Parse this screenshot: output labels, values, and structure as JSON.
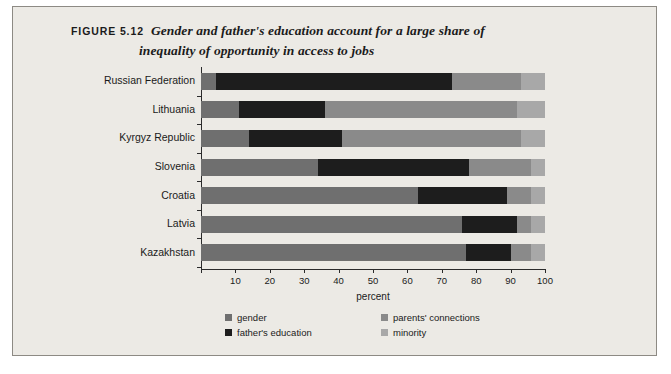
{
  "figure": {
    "number": "FIGURE 5.12",
    "title_line_1": "Gender and father's education account for a large share of",
    "title_line_2": "inequality of opportunity in access to jobs"
  },
  "colors": {
    "panel_background": "#eceae5",
    "gender": "#6f6f6f",
    "father_education": "#1d1d1d",
    "parents_connections": "#8a8a8a",
    "minority": "#a8a8a8",
    "axis": "#2b2b2b"
  },
  "chart_data": {
    "type": "bar",
    "orientation": "horizontal",
    "stacked": true,
    "title": "Gender and father's education account for a large share of inequality of opportunity in access to jobs",
    "xlabel": "percent",
    "ylabel": "",
    "xlim": [
      0,
      100
    ],
    "xticks": [
      0,
      10,
      20,
      30,
      40,
      50,
      60,
      70,
      80,
      90,
      100
    ],
    "xtick_labels": [
      "",
      "10",
      "20",
      "30",
      "40",
      "50",
      "60",
      "70",
      "80",
      "90",
      "100"
    ],
    "grid": false,
    "legend_position": "bottom",
    "categories": [
      "Russian Federation",
      "Lithuania",
      "Kyrgyz Republic",
      "Slovenia",
      "Croatia",
      "Latvia",
      "Kazakhstan"
    ],
    "series": [
      {
        "name": "gender",
        "color": "#6f6f6f",
        "values": [
          4.5,
          11.0,
          14.0,
          34.0,
          63.0,
          76.0,
          77.0
        ]
      },
      {
        "name": "father's education",
        "color": "#1d1d1d",
        "values": [
          68.5,
          25.0,
          27.0,
          44.0,
          26.0,
          16.0,
          13.0
        ]
      },
      {
        "name": "parents' connections",
        "color": "#8a8a8a",
        "values": [
          20.0,
          56.0,
          52.0,
          18.0,
          7.0,
          4.0,
          6.0
        ]
      },
      {
        "name": "minority",
        "color": "#a8a8a8",
        "values": [
          7.0,
          8.0,
          7.0,
          4.0,
          4.0,
          4.0,
          4.0
        ]
      }
    ]
  },
  "legend": [
    {
      "label": "gender",
      "color": "#6f6f6f"
    },
    {
      "label": "parents' connections",
      "color": "#8a8a8a"
    },
    {
      "label": "father's education",
      "color": "#1d1d1d"
    },
    {
      "label": "minority",
      "color": "#a8a8a8"
    }
  ]
}
